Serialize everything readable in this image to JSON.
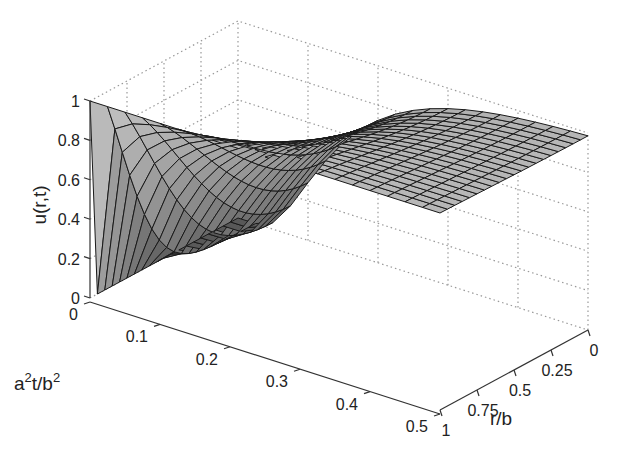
{
  "chart_data": {
    "type": "surface3d",
    "title": "",
    "xlabel": "r/b",
    "ylabel": "a^2t/b^2",
    "zlabel": "u(r,t)",
    "x_ticks": [
      "0",
      "0.25",
      "0.5",
      "0.75",
      "1"
    ],
    "y_ticks": [
      "0",
      "0.1",
      "0.2",
      "0.3",
      "0.4",
      "0.5"
    ],
    "z_ticks": [
      "0",
      "0.2",
      "0.4",
      "0.6",
      "0.8",
      "1"
    ],
    "xlim": [
      0,
      1
    ],
    "ylim": [
      0,
      0.5
    ],
    "zlim": [
      0,
      1
    ],
    "grid": true,
    "mesh": {
      "r_divisions": 20,
      "t_divisions": 20
    },
    "sample_values": [
      {
        "r": 1,
        "t": 0,
        "u": 1
      },
      {
        "r": 0.95,
        "t": 0,
        "u": 0
      },
      {
        "r": 0,
        "t": 0,
        "u": 0
      },
      {
        "r": 0,
        "t": 0.1,
        "u": 0.2
      },
      {
        "r": 0,
        "t": 0.2,
        "u": 0.55
      },
      {
        "r": 0,
        "t": 0.5,
        "u": 0.95
      },
      {
        "r": 1,
        "t": 0.5,
        "u": 1
      }
    ]
  },
  "labels": {
    "z_axis": "u(r,t)",
    "t_axis_base": "a",
    "t_axis_sup1": "2",
    "t_axis_mid": "t/b",
    "t_axis_sup2": "2",
    "r_axis": "r/b"
  },
  "colors": {
    "surface_light": "#c8c8c8",
    "surface_dark": "#585858",
    "mesh_line": "#1a1a1a",
    "grid": "#999999"
  }
}
